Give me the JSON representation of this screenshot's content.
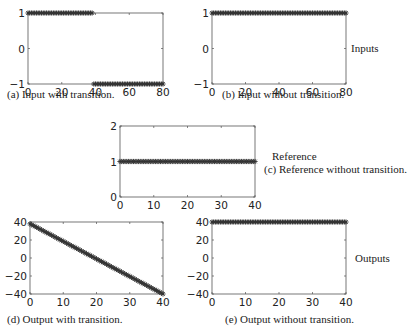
{
  "figure": {
    "side_labels": {
      "inputs": "Inputs",
      "reference": "Reference",
      "outputs": "Outputs"
    },
    "captions": {
      "a": "(a) Input with transition.",
      "b": "(b) Input without transition.",
      "c": "(c) Reference without transition.",
      "d": "(d) Output with transition.",
      "e": "(e) Output without transition."
    },
    "marker_color": "#333333",
    "axis_color": "#555555"
  },
  "chart_data": [
    {
      "id": "a",
      "type": "line",
      "title": "(a) Input with transition.",
      "xlabel": "",
      "ylabel": "",
      "xlim": [
        0,
        80
      ],
      "ylim": [
        -1,
        1
      ],
      "xticks": [
        0,
        20,
        40,
        60,
        80
      ],
      "yticks": [
        -1,
        0,
        1
      ],
      "series": [
        {
          "name": "input",
          "marker": "*",
          "segments": [
            {
              "x_start": 0,
              "x_end": 38,
              "y": 1
            },
            {
              "x_start": 39,
              "x_end": 80,
              "y": -1
            }
          ]
        }
      ],
      "grid": false,
      "legend": null
    },
    {
      "id": "b",
      "type": "line",
      "title": "(b) Input without transition.",
      "xlabel": "",
      "ylabel": "",
      "xlim": [
        0,
        80
      ],
      "ylim": [
        -1,
        1
      ],
      "xticks": [
        0,
        20,
        40,
        60,
        80
      ],
      "yticks": [
        -1,
        0,
        1
      ],
      "series": [
        {
          "name": "input",
          "marker": "*",
          "segments": [
            {
              "x_start": 0,
              "x_end": 80,
              "y": 1
            }
          ]
        }
      ],
      "grid": false,
      "legend": null
    },
    {
      "id": "c",
      "type": "line",
      "title": "(c) Reference without transition.",
      "xlabel": "",
      "ylabel": "",
      "xlim": [
        0,
        40
      ],
      "ylim": [
        0,
        2
      ],
      "xticks": [
        0,
        10,
        20,
        30,
        40
      ],
      "yticks": [
        0,
        1,
        2
      ],
      "series": [
        {
          "name": "reference",
          "marker": "*",
          "segments": [
            {
              "x_start": 0,
              "x_end": 40,
              "y": 1
            }
          ]
        }
      ],
      "grid": false,
      "legend": null
    },
    {
      "id": "d",
      "type": "line",
      "title": "(d) Output with transition.",
      "xlabel": "",
      "ylabel": "",
      "xlim": [
        0,
        40
      ],
      "ylim": [
        -40,
        40
      ],
      "xticks": [
        0,
        10,
        20,
        30,
        40
      ],
      "yticks": [
        -40,
        -20,
        0,
        20,
        40
      ],
      "series": [
        {
          "name": "output",
          "marker": "*",
          "linear": {
            "x_start": 0,
            "y_start": 38,
            "x_end": 40,
            "y_end": -40
          }
        }
      ],
      "grid": false,
      "legend": null
    },
    {
      "id": "e",
      "type": "line",
      "title": "(e) Output without transition.",
      "xlabel": "",
      "ylabel": "",
      "xlim": [
        0,
        40
      ],
      "ylim": [
        -40,
        40
      ],
      "xticks": [
        0,
        10,
        20,
        30,
        40
      ],
      "yticks": [
        -40,
        -20,
        0,
        20,
        40
      ],
      "series": [
        {
          "name": "output",
          "marker": "*",
          "segments": [
            {
              "x_start": 0,
              "x_end": 40,
              "y": 40
            }
          ]
        }
      ],
      "grid": false,
      "legend": null
    }
  ]
}
